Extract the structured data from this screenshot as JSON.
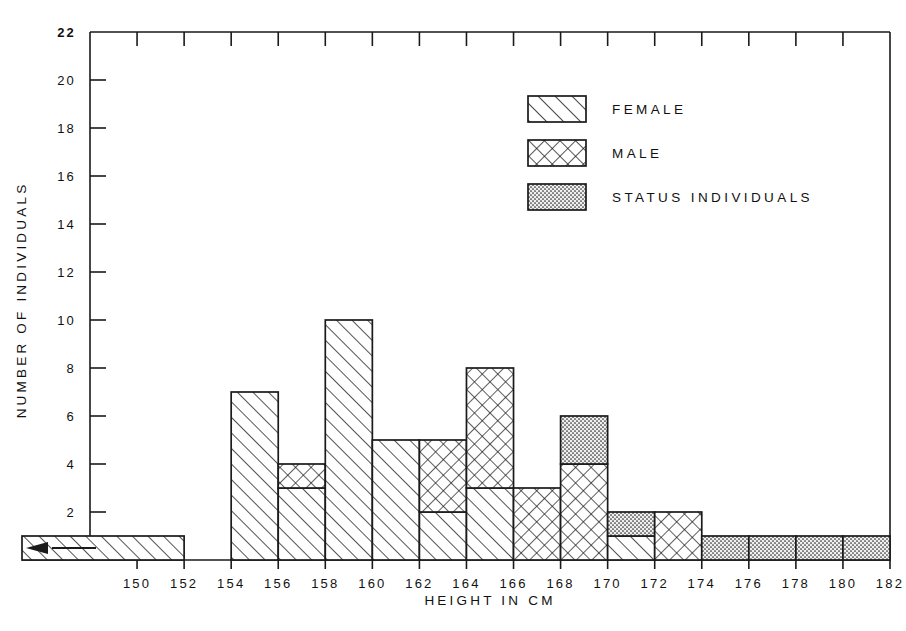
{
  "chart_data": {
    "type": "bar",
    "title": "",
    "xlabel": "HEIGHT IN CM",
    "ylabel": "NUMBER OF INDIVIDUALS",
    "xlim": [
      148,
      182
    ],
    "ylim": [
      0,
      22
    ],
    "ytick_step": 2,
    "xtick_step": 2,
    "grid": false,
    "stacked": true,
    "bin_width": 2,
    "legend_position": "upper-center-right",
    "xticks": [
      "150",
      "152",
      "154",
      "156",
      "158",
      "160",
      "162",
      "164",
      "166",
      "168",
      "170",
      "172",
      "174",
      "176",
      "178",
      "180",
      "182"
    ],
    "yticks": [
      "2",
      "4",
      "6",
      "8",
      "10",
      "12",
      "14",
      "16",
      "18",
      "20",
      "22"
    ],
    "series": [
      {
        "name": "FEMALE",
        "pattern": "diagonal-hatch",
        "color": "#1a1a1a"
      },
      {
        "name": "MALE",
        "pattern": "cross-hatch",
        "color": "#1a1a1a"
      },
      {
        "name": "STATUS INDIVIDUALS",
        "pattern": "stipple-dots",
        "color": "#1a1a1a"
      }
    ],
    "bins": [
      {
        "start": 148,
        "end": 152,
        "female": 1,
        "male": 0,
        "status": 0,
        "total": 1,
        "open_left": true
      },
      {
        "start": 152,
        "end": 154,
        "female": 0,
        "male": 0,
        "status": 0,
        "total": 0
      },
      {
        "start": 154,
        "end": 156,
        "female": 7,
        "male": 0,
        "status": 0,
        "total": 7
      },
      {
        "start": 156,
        "end": 158,
        "female": 3,
        "male": 1,
        "status": 0,
        "total": 4
      },
      {
        "start": 158,
        "end": 160,
        "female": 10,
        "male": 0,
        "status": 0,
        "total": 10
      },
      {
        "start": 160,
        "end": 162,
        "female": 5,
        "male": 0,
        "status": 0,
        "total": 5
      },
      {
        "start": 162,
        "end": 164,
        "female": 2,
        "male": 3,
        "status": 0,
        "total": 5
      },
      {
        "start": 164,
        "end": 166,
        "female": 3,
        "male": 5,
        "status": 0,
        "total": 8
      },
      {
        "start": 166,
        "end": 168,
        "female": 0,
        "male": 3,
        "status": 0,
        "total": 3
      },
      {
        "start": 168,
        "end": 170,
        "female": 0,
        "male": 4,
        "status": 2,
        "total": 6
      },
      {
        "start": 170,
        "end": 172,
        "female": 1,
        "male": 0,
        "status": 1,
        "total": 2
      },
      {
        "start": 172,
        "end": 174,
        "female": 0,
        "male": 2,
        "status": 0,
        "total": 2
      },
      {
        "start": 174,
        "end": 176,
        "female": 0,
        "male": 0,
        "status": 1,
        "total": 1
      },
      {
        "start": 176,
        "end": 178,
        "female": 0,
        "male": 0,
        "status": 1,
        "total": 1
      },
      {
        "start": 178,
        "end": 180,
        "female": 0,
        "male": 0,
        "status": 1,
        "total": 1
      },
      {
        "start": 180,
        "end": 182,
        "female": 0,
        "male": 0,
        "status": 1,
        "total": 1
      }
    ],
    "annotations": [
      {
        "name": "left-open-arrow",
        "text": "",
        "at_bin": 0,
        "direction": "left",
        "meaning": "bin extends below 150"
      }
    ]
  },
  "legend": {
    "entries": [
      {
        "label": "FEMALE",
        "icon": "diagonal-hatch-swatch"
      },
      {
        "label": "MALE",
        "icon": "cross-hatch-swatch"
      },
      {
        "label": "STATUS INDIVIDUALS",
        "icon": "stipple-swatch"
      }
    ]
  },
  "axes": {
    "x_title": "HEIGHT IN CM",
    "y_title": "NUMBER OF INDIVIDUALS"
  },
  "colors": {
    "ink": "#1a1a1a",
    "paper": "#ffffff"
  }
}
